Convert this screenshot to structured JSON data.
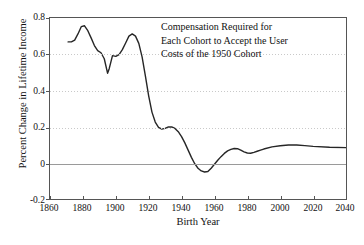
{
  "chart_data": {
    "type": "line",
    "title": "",
    "xlabel": "Birth Year",
    "ylabel": "Percent Change in Lifetime Income",
    "xlim": [
      1860,
      2040
    ],
    "ylim": [
      -0.2,
      0.8
    ],
    "xticks": [
      "1860",
      "1880",
      "1900",
      "1920",
      "1940",
      "1960",
      "1980",
      "2000",
      "2020",
      "2040"
    ],
    "yticks": [
      "0.8",
      "0.6",
      "0.4",
      "0.2",
      "0",
      "-0.2"
    ],
    "grid": "horizontal-dotted",
    "legend": "none",
    "annotations": [
      "Compensation Required for",
      "Each Cohort to Accept the User",
      "Costs of the 1950 Cohort"
    ],
    "series": [
      {
        "name": "Percent Change in Lifetime Income",
        "color": "#262626",
        "x": [
          1871,
          1873,
          1875,
          1877,
          1879,
          1881,
          1883,
          1885,
          1887,
          1889,
          1891,
          1893,
          1895,
          1896,
          1898,
          1900,
          1902,
          1904,
          1906,
          1908,
          1910,
          1912,
          1914,
          1916,
          1918,
          1920,
          1922,
          1924,
          1926,
          1928,
          1930,
          1932,
          1934,
          1936,
          1938,
          1940,
          1942,
          1944,
          1946,
          1948,
          1950,
          1952,
          1954,
          1956,
          1958,
          1960,
          1962,
          1964,
          1966,
          1968,
          1970,
          1972,
          1974,
          1976,
          1978,
          1980,
          1982,
          1984,
          1986,
          1988,
          1990,
          1995,
          2000,
          2005,
          2010,
          2015,
          2020,
          2030,
          2040
        ],
        "y": [
          0.668,
          0.668,
          0.678,
          0.712,
          0.752,
          0.757,
          0.73,
          0.69,
          0.648,
          0.62,
          0.608,
          0.575,
          0.495,
          0.52,
          0.592,
          0.588,
          0.598,
          0.625,
          0.662,
          0.7,
          0.712,
          0.7,
          0.66,
          0.585,
          0.48,
          0.37,
          0.28,
          0.225,
          0.196,
          0.186,
          0.19,
          0.198,
          0.198,
          0.19,
          0.172,
          0.145,
          0.11,
          0.07,
          0.03,
          -0.005,
          -0.03,
          -0.045,
          -0.051,
          -0.048,
          -0.03,
          -0.008,
          0.014,
          0.034,
          0.052,
          0.066,
          0.074,
          0.079,
          0.078,
          0.07,
          0.06,
          0.054,
          0.053,
          0.058,
          0.064,
          0.07,
          0.076,
          0.088,
          0.094,
          0.098,
          0.098,
          0.095,
          0.091,
          0.086,
          0.084
        ]
      }
    ]
  },
  "axis": {
    "x_title": "Birth Year",
    "y_title": "Percent Change in Lifetime Income"
  }
}
